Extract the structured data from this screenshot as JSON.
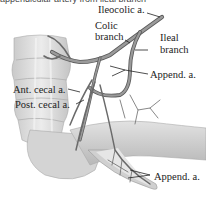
{
  "figure": {
    "caption_fragment": "appendicular artery from ileal branch",
    "labels": {
      "ileocolic": "Ileocolic a.",
      "colic_1": "Colic",
      "colic_2": "branch",
      "ileal_1": "Ileal",
      "ileal_2": "branch",
      "append_upper": "Append. a.",
      "ant_cecal": "Ant. cecal a.",
      "post_cecal": "Post. cecal a.",
      "append_lower": "Append. a."
    },
    "colors": {
      "artery": "#8a8a8a",
      "artery_outline": "#5a5a5a",
      "tissue": "#d9d9d9",
      "tissue_shadow": "#b5b5b5",
      "leader_line": "#222222"
    }
  }
}
